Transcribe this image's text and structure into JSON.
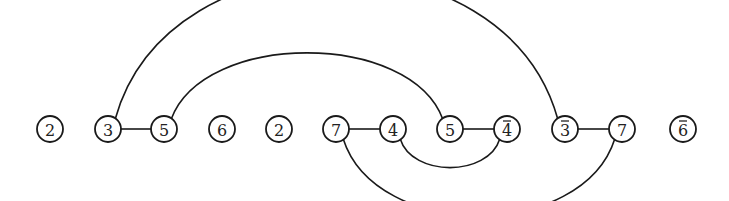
{
  "diagram": {
    "type": "arc-diagram",
    "node_y": 129,
    "node_radius": 13,
    "nodes": [
      {
        "id": "n0",
        "label": "2",
        "overline": false,
        "x": 50
      },
      {
        "id": "n1",
        "label": "3",
        "overline": false,
        "x": 108
      },
      {
        "id": "n2",
        "label": "5",
        "overline": false,
        "x": 164
      },
      {
        "id": "n3",
        "label": "6",
        "overline": false,
        "x": 222
      },
      {
        "id": "n4",
        "label": "2",
        "overline": false,
        "x": 279
      },
      {
        "id": "n5",
        "label": "7",
        "overline": false,
        "x": 336
      },
      {
        "id": "n6",
        "label": "4",
        "overline": false,
        "x": 393
      },
      {
        "id": "n7",
        "label": "5",
        "overline": false,
        "x": 450
      },
      {
        "id": "n8",
        "label": "4",
        "overline": true,
        "x": 507
      },
      {
        "id": "n9",
        "label": "3",
        "overline": true,
        "x": 565
      },
      {
        "id": "n10",
        "label": "7",
        "overline": false,
        "x": 622
      },
      {
        "id": "n11",
        "label": "6",
        "overline": true,
        "x": 683
      }
    ],
    "edges": [
      {
        "from": "n1",
        "to": "n2",
        "style": "straight"
      },
      {
        "from": "n5",
        "to": "n6",
        "style": "straight"
      },
      {
        "from": "n7",
        "to": "n8",
        "style": "straight"
      },
      {
        "from": "n9",
        "to": "n10",
        "style": "straight"
      },
      {
        "from": "n1",
        "to": "n9",
        "style": "arc-above",
        "peak_y": 23
      },
      {
        "from": "n2",
        "to": "n7",
        "style": "arc-above",
        "peak_y": 75
      },
      {
        "from": "n6",
        "to": "n8",
        "style": "arc-below",
        "peak_y": 158
      },
      {
        "from": "n5",
        "to": "n10",
        "style": "arc-below",
        "peak_y": 190
      }
    ]
  }
}
